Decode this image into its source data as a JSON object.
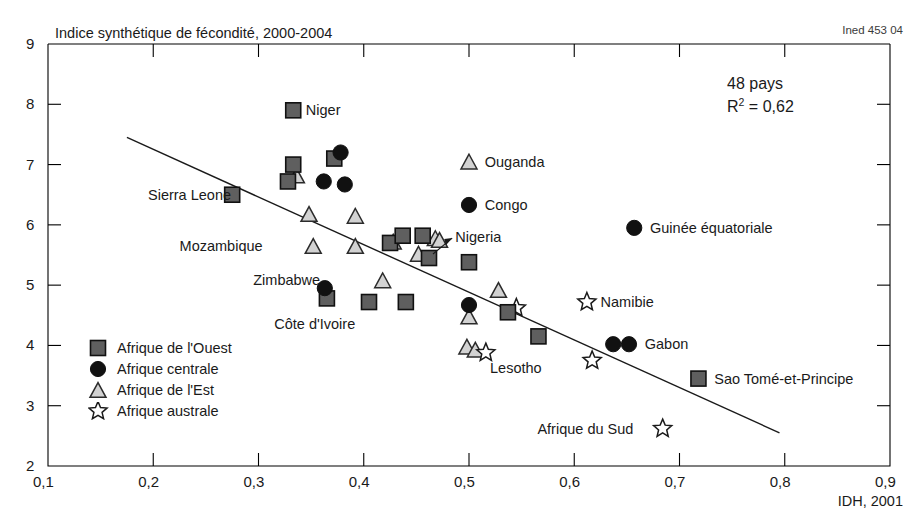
{
  "figure": {
    "title": "Indice synthétique de fécondité, 2000-2004",
    "source_note": "Ined 453 04",
    "xaxis_title": "IDH, 2001",
    "stat_count": "48 pays",
    "stat_r2_prefix": "R",
    "stat_r2_exp": "2",
    "stat_r2_value": " = 0,62"
  },
  "legend": {
    "items": [
      {
        "label": "Afrique de l'Ouest",
        "marker": "square-marker",
        "color": "#5f5f5f"
      },
      {
        "label": "Afrique centrale",
        "marker": "circle-marker",
        "color": "#111111"
      },
      {
        "label": "Afrique de l'Est",
        "marker": "triangle-marker",
        "color": "#d2d2d2"
      },
      {
        "label": "Afrique australe",
        "marker": "star-marker",
        "color": "#ffffff"
      }
    ]
  },
  "chart_data": {
    "type": "scatter",
    "title": "Indice synthétique de fécondité, 2000-2004",
    "xlabel": "IDH, 2001",
    "ylabel": "Indice synthétique de fécondité",
    "xlim": [
      0.1,
      0.9
    ],
    "ylim": [
      2,
      9
    ],
    "xticks": [
      "0,1",
      "0,2",
      "0,3",
      "0,4",
      "0,5",
      "0,6",
      "0,7",
      "0,8",
      "0,9"
    ],
    "xtick_values": [
      0.1,
      0.2,
      0.3,
      0.4,
      0.5,
      0.6,
      0.7,
      0.8,
      0.9
    ],
    "yticks": [
      "2",
      "3",
      "4",
      "5",
      "6",
      "7",
      "8",
      "9"
    ],
    "ytick_values": [
      2,
      3,
      4,
      5,
      6,
      7,
      8,
      9
    ],
    "grid": false,
    "n_points": 48,
    "r_squared": 0.62,
    "trendline": {
      "x0": 0.175,
      "y0": 7.45,
      "x1": 0.795,
      "y1": 2.55
    },
    "series": [
      {
        "name": "Afrique de l'Ouest",
        "marker": "square",
        "color": "#5f5f5f",
        "points": [
          {
            "x": 0.275,
            "y": 6.5,
            "label": "Sierra Leone",
            "label_side": "left"
          },
          {
            "x": 0.333,
            "y": 7.9,
            "label": "Niger",
            "label_side": "right"
          },
          {
            "x": 0.333,
            "y": 7.0,
            "label": ""
          },
          {
            "x": 0.328,
            "y": 6.72,
            "label": ""
          },
          {
            "x": 0.372,
            "y": 7.1,
            "label": ""
          },
          {
            "x": 0.365,
            "y": 4.78,
            "label": ""
          },
          {
            "x": 0.425,
            "y": 5.7,
            "label": ""
          },
          {
            "x": 0.437,
            "y": 5.82,
            "label": ""
          },
          {
            "x": 0.405,
            "y": 4.72,
            "label": ""
          },
          {
            "x": 0.462,
            "y": 5.45,
            "label": "Nigeria",
            "label_side": "arrow"
          },
          {
            "x": 0.456,
            "y": 5.82,
            "label": ""
          },
          {
            "x": 0.5,
            "y": 5.38,
            "label": ""
          },
          {
            "x": 0.44,
            "y": 4.72,
            "label": ""
          },
          {
            "x": 0.537,
            "y": 4.55,
            "label": ""
          },
          {
            "x": 0.566,
            "y": 4.15,
            "label": ""
          },
          {
            "x": 0.718,
            "y": 3.45,
            "label": "Sao Tomé-et-Principe",
            "label_side": "right"
          }
        ]
      },
      {
        "name": "Afrique centrale",
        "marker": "circle",
        "color": "#111111",
        "points": [
          {
            "x": 0.378,
            "y": 7.2,
            "label": ""
          },
          {
            "x": 0.362,
            "y": 6.72,
            "label": ""
          },
          {
            "x": 0.382,
            "y": 6.67,
            "label": ""
          },
          {
            "x": 0.363,
            "y": 4.95,
            "label": ""
          },
          {
            "x": 0.5,
            "y": 6.33,
            "label": "Congo",
            "label_side": "right"
          },
          {
            "x": 0.5,
            "y": 4.67,
            "label": ""
          },
          {
            "x": 0.657,
            "y": 5.95,
            "label": "Guinée équatoriale",
            "label_side": "right"
          },
          {
            "x": 0.637,
            "y": 4.02,
            "label": ""
          },
          {
            "x": 0.652,
            "y": 4.02,
            "label": "Gabon",
            "label_side": "right"
          }
        ]
      },
      {
        "name": "Afrique de l'Est",
        "marker": "triangle",
        "color": "#d2d2d2",
        "points": [
          {
            "x": 0.336,
            "y": 6.82,
            "label": ""
          },
          {
            "x": 0.348,
            "y": 6.18,
            "label": ""
          },
          {
            "x": 0.392,
            "y": 6.15,
            "label": ""
          },
          {
            "x": 0.352,
            "y": 5.65,
            "label": "Mozambique",
            "label_side": "left"
          },
          {
            "x": 0.392,
            "y": 5.65,
            "label": ""
          },
          {
            "x": 0.428,
            "y": 5.72,
            "label": ""
          },
          {
            "x": 0.418,
            "y": 5.08,
            "label": "Zimbabwe",
            "label_side": "left"
          },
          {
            "x": 0.452,
            "y": 5.52,
            "label": ""
          },
          {
            "x": 0.468,
            "y": 5.78,
            "label": ""
          },
          {
            "x": 0.472,
            "y": 5.75,
            "label": ""
          },
          {
            "x": 0.5,
            "y": 7.05,
            "label": "Ouganda",
            "label_side": "right"
          },
          {
            "x": 0.5,
            "y": 4.48,
            "label": ""
          },
          {
            "x": 0.528,
            "y": 4.92,
            "label": ""
          },
          {
            "x": 0.498,
            "y": 3.98,
            "label": ""
          },
          {
            "x": 0.506,
            "y": 3.93,
            "label": ""
          }
        ]
      },
      {
        "name": "Afrique australe",
        "marker": "star",
        "color": "#ffffff",
        "points": [
          {
            "x": 0.545,
            "y": 4.62,
            "label": ""
          },
          {
            "x": 0.516,
            "y": 3.88,
            "label": "Lesotho",
            "label_side": "below"
          },
          {
            "x": 0.612,
            "y": 4.72,
            "label": "Namibie",
            "label_side": "right"
          },
          {
            "x": 0.617,
            "y": 3.75,
            "label": ""
          },
          {
            "x": 0.684,
            "y": 2.62,
            "label": "Afrique du Sud",
            "label_side": "left"
          }
        ]
      }
    ],
    "annotations": [
      {
        "text": "Niger",
        "x": 0.345,
        "y": 7.9
      },
      {
        "text": "Sierra Leone",
        "x": 0.195,
        "y": 6.5
      },
      {
        "text": "Mozambique",
        "x": 0.225,
        "y": 5.65
      },
      {
        "text": "Zimbabwe",
        "x": 0.295,
        "y": 5.08
      },
      {
        "text": "Côte d'Ivoire",
        "x": 0.315,
        "y": 4.35
      },
      {
        "text": "Ouganda",
        "x": 0.515,
        "y": 7.05
      },
      {
        "text": "Congo",
        "x": 0.515,
        "y": 6.33
      },
      {
        "text": "Nigeria",
        "x": 0.487,
        "y": 5.8
      },
      {
        "text": "Lesotho",
        "x": 0.52,
        "y": 3.63
      },
      {
        "text": "Namibie",
        "x": 0.625,
        "y": 4.72
      },
      {
        "text": "Gabon",
        "x": 0.667,
        "y": 4.02
      },
      {
        "text": "Guinée équatoriale",
        "x": 0.672,
        "y": 5.95
      },
      {
        "text": "Sao Tomé-et-Principe",
        "x": 0.733,
        "y": 3.45
      },
      {
        "text": "Afrique du Sud",
        "x": 0.565,
        "y": 2.62
      }
    ]
  },
  "labels": {
    "niger": "Niger",
    "sierra_leone": "Sierra Leone",
    "mozambique": "Mozambique",
    "zimbabwe": "Zimbabwe",
    "cote_divoire": "Côte d'Ivoire",
    "ouganda": "Ouganda",
    "congo": "Congo",
    "nigeria": "Nigeria",
    "lesotho": "Lesotho",
    "namibie": "Namibie",
    "gabon": "Gabon",
    "guinee_equatoriale": "Guinée équatoriale",
    "sao_tome": "Sao Tomé-et-Principe",
    "afrique_du_sud": "Afrique du Sud"
  }
}
